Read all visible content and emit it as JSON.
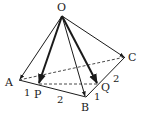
{
  "diagram": {
    "type": "pyramid-vectors",
    "points": {
      "O": {
        "label": "O",
        "x": 62,
        "y": 16
      },
      "A": {
        "label": "A",
        "x": 19,
        "y": 80
      },
      "P": {
        "label": "P",
        "x": 39,
        "y": 84
      },
      "B": {
        "label": "B",
        "x": 86,
        "y": 97
      },
      "Q": {
        "label": "Q",
        "x": 98,
        "y": 84
      },
      "C": {
        "label": "C",
        "x": 125,
        "y": 57
      }
    },
    "segment_labels": {
      "AP": "1",
      "PB": "2",
      "BQ": "1",
      "QC": "2"
    },
    "colors": {
      "line": "#1a1a1a",
      "background": "#ffffff"
    }
  }
}
